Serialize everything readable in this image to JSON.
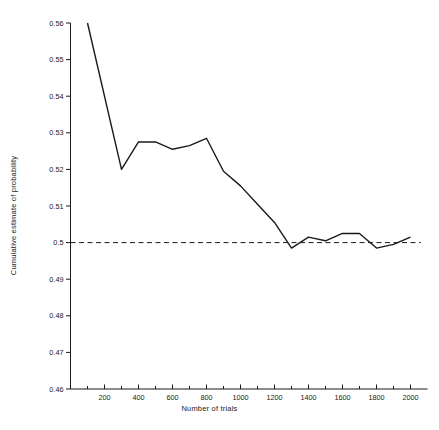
{
  "chart_data": {
    "type": "line",
    "title": "",
    "xlabel": "Number of trials",
    "ylabel": "Cumulative estimate of probability",
    "xlim": [
      0,
      2060
    ],
    "ylim": [
      0.46,
      0.56
    ],
    "grid": false,
    "legend": null,
    "xticks": [
      200,
      400,
      600,
      800,
      1000,
      1200,
      1400,
      1600,
      1800,
      2000
    ],
    "xticklabels": [
      "200",
      "400",
      "600",
      "800",
      "1000",
      "1200",
      "1400",
      "1600",
      "1800",
      "2000"
    ],
    "xminorticks": [
      100,
      300,
      500,
      700,
      900,
      1100,
      1300,
      1500,
      1700,
      1900
    ],
    "yticks": [
      0.46,
      0.47,
      0.48,
      0.49,
      0.5,
      0.51,
      0.52,
      0.53,
      0.54,
      0.55,
      0.56
    ],
    "yticklabels": [
      "0.46",
      "0.47",
      "0.48",
      "0.49",
      "0.5",
      "0.51",
      "0.52",
      "0.53",
      "0.54",
      "0.55",
      "0.56"
    ],
    "series": [
      {
        "name": "Cumulative estimate",
        "style": "solid",
        "color": "#1a1a1a",
        "x": [
          100,
          300,
          400,
          500,
          600,
          700,
          800,
          900,
          1000,
          1100,
          1200,
          1300,
          1400,
          1500,
          1600,
          1700,
          1800,
          1900,
          2000
        ],
        "values": [
          0.56,
          0.52,
          0.5275,
          0.5275,
          0.5255,
          0.5265,
          0.5285,
          0.5195,
          0.5155,
          0.5105,
          0.5055,
          0.4985,
          0.5015,
          0.5005,
          0.5025,
          0.5025,
          0.4985,
          0.4995,
          0.5015
        ]
      },
      {
        "name": "Reference level 0.5",
        "style": "dashed",
        "color": "#1a1a1a",
        "x": [
          0,
          2060
        ],
        "values": [
          0.5,
          0.5
        ]
      }
    ]
  }
}
